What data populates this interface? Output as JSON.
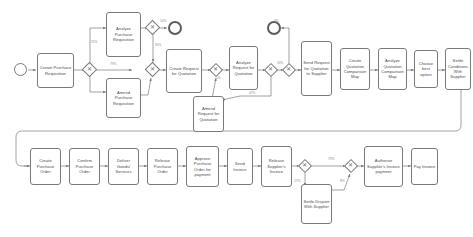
{
  "diagram": {
    "notation": "BPMN",
    "stroke_color": "#7a7a7a",
    "text_color": "#4a4a4a",
    "label_color": "#8a8a8a",
    "background": "#ffffff"
  },
  "events": [
    {
      "id": "start",
      "type": "start",
      "label": ""
    },
    {
      "id": "end_top",
      "type": "end",
      "label": ""
    }
  ],
  "tasks": [
    {
      "id": "create_purchase_requisition",
      "label": "Create Purchase Requisition"
    },
    {
      "id": "analyze_purchase_requisition",
      "label": "Analyze Purchase Requisition"
    },
    {
      "id": "amend_purchase_requisition",
      "label": "Amend Purchase Requisition"
    },
    {
      "id": "create_request_for_quotation",
      "label": "Create Request for Quotation"
    },
    {
      "id": "analyze_request_for_quotation",
      "label": "Analyze Request for Quotation"
    },
    {
      "id": "amend_request_for_quotation",
      "label": "Amend Request for Quotation"
    },
    {
      "id": "send_request_for_quotation_to_supplier",
      "label": "Send Request for Quotation to Supplier"
    },
    {
      "id": "create_quotation_comparison_map",
      "label": "Create Quotation Comparison Map"
    },
    {
      "id": "analyze_quotation_comparison_map",
      "label": "Analyze Quotation Comparison Map"
    },
    {
      "id": "choose_best_option",
      "label": "Choose best option"
    },
    {
      "id": "settle_conditions_with_supplier",
      "label": "Settle Conditions With Supplier"
    },
    {
      "id": "create_purchase_order",
      "label": "Create Purchase Order"
    },
    {
      "id": "confirm_purchase_order",
      "label": "Confirm Purchase Order"
    },
    {
      "id": "deliver_goods_services",
      "label": "Deliver Goods/ Services"
    },
    {
      "id": "release_purchase_order",
      "label": "Release Purchase Order"
    },
    {
      "id": "approve_purchase_order_for_payment",
      "label": "Approve Purchase Order for payment"
    },
    {
      "id": "send_invoice",
      "label": "Send Invoice"
    },
    {
      "id": "release_suppliers_invoice",
      "label": "Release Supplier's Invoice"
    },
    {
      "id": "settle_dispute_with_supplier",
      "label": "Settle Dispute With Supplier"
    },
    {
      "id": "authorize_suppliers_invoice_payment",
      "label": "Authorize Supplier's Invoice payment"
    },
    {
      "id": "pay_invoice",
      "label": "Pay Invoice"
    }
  ],
  "gateways": [
    {
      "id": "gw_after_create_pr",
      "type": "exclusive",
      "mark": "✕"
    },
    {
      "id": "gw_after_analyze_pr",
      "type": "exclusive",
      "mark": "✕"
    },
    {
      "id": "gw_join_pr",
      "type": "exclusive",
      "mark": "✕"
    },
    {
      "id": "gw_before_analyze_rfq",
      "type": "exclusive",
      "mark": "✕"
    },
    {
      "id": "gw_after_analyze_rfq",
      "type": "exclusive",
      "mark": "✕"
    },
    {
      "id": "gw_join_rfq",
      "type": "exclusive",
      "mark": "✕"
    },
    {
      "id": "gw_after_release_invoice",
      "type": "exclusive",
      "mark": "✕"
    },
    {
      "id": "gw_join_invoice",
      "type": "exclusive",
      "mark": "✕"
    }
  ],
  "flow_labels": [
    {
      "id": "lbl_pr_analyze",
      "text": "21%"
    },
    {
      "id": "lbl_pr_direct",
      "text": "79%"
    },
    {
      "id": "lbl_pr_end",
      "text": "10%"
    },
    {
      "id": "lbl_pr_back",
      "text": "90%"
    },
    {
      "id": "lbl_rfq_split",
      "text": "5%"
    },
    {
      "id": "lbl_rfq_amend",
      "text": "47%"
    },
    {
      "id": "lbl_rfq_send",
      "text": "53%"
    },
    {
      "id": "lbl_rfq_end",
      "text": "3%"
    },
    {
      "id": "lbl_inv_ok",
      "text": "73%"
    },
    {
      "id": "lbl_inv_dispute",
      "text": "27%"
    },
    {
      "id": "lbl_inv_rejoin",
      "text": "8%"
    }
  ]
}
